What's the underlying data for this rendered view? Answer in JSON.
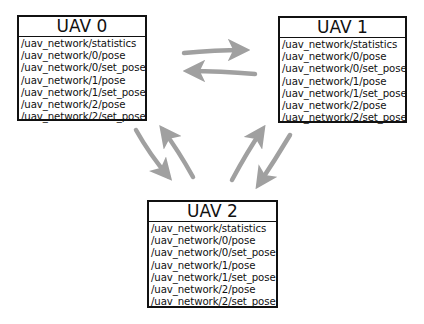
{
  "diagram": {
    "nodes": [
      {
        "title": "UAV 0",
        "topics": [
          "/uav_network/statistics",
          "/uav_network/0/pose",
          "/uav_network/0/set_pose",
          "/uav_network/1/pose",
          "/uav_network/1/set_pose",
          "/uav_network/2/pose",
          "/uav_network/2/set_pose"
        ]
      },
      {
        "title": "UAV 1",
        "topics": [
          "/uav_network/statistics",
          "/uav_network/0/pose",
          "/uav_network/0/set_pose",
          "/uav_network/1/pose",
          "/uav_network/1/set_pose",
          "/uav_network/2/pose",
          "/uav_network/2/set_pose"
        ]
      },
      {
        "title": "UAV 2",
        "topics": [
          "/uav_network/statistics",
          "/uav_network/0/pose",
          "/uav_network/0/set_pose",
          "/uav_network/1/pose",
          "/uav_network/1/set_pose",
          "/uav_network/2/pose",
          "/uav_network/2/set_pose"
        ]
      }
    ],
    "edges": [
      {
        "from": "UAV 0",
        "to": "UAV 1"
      },
      {
        "from": "UAV 1",
        "to": "UAV 0"
      },
      {
        "from": "UAV 0",
        "to": "UAV 2"
      },
      {
        "from": "UAV 2",
        "to": "UAV 0"
      },
      {
        "from": "UAV 2",
        "to": "UAV 1"
      },
      {
        "from": "UAV 1",
        "to": "UAV 2"
      }
    ],
    "colors": {
      "arrow": "#a0a0a0",
      "border": "#111111",
      "background": "#ffffff"
    }
  }
}
